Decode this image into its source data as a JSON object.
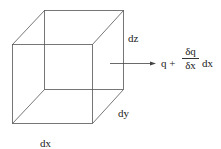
{
  "diagram": {
    "type": "cube-flux-element",
    "labels": {
      "dz": "dz",
      "dy": "dy",
      "dx": "dx"
    },
    "equation": {
      "lhs": "q +",
      "numerator": "δq",
      "denominator": "δx",
      "suffix": "dx"
    },
    "colors": {
      "line": "#555555",
      "text": "#222222"
    }
  }
}
